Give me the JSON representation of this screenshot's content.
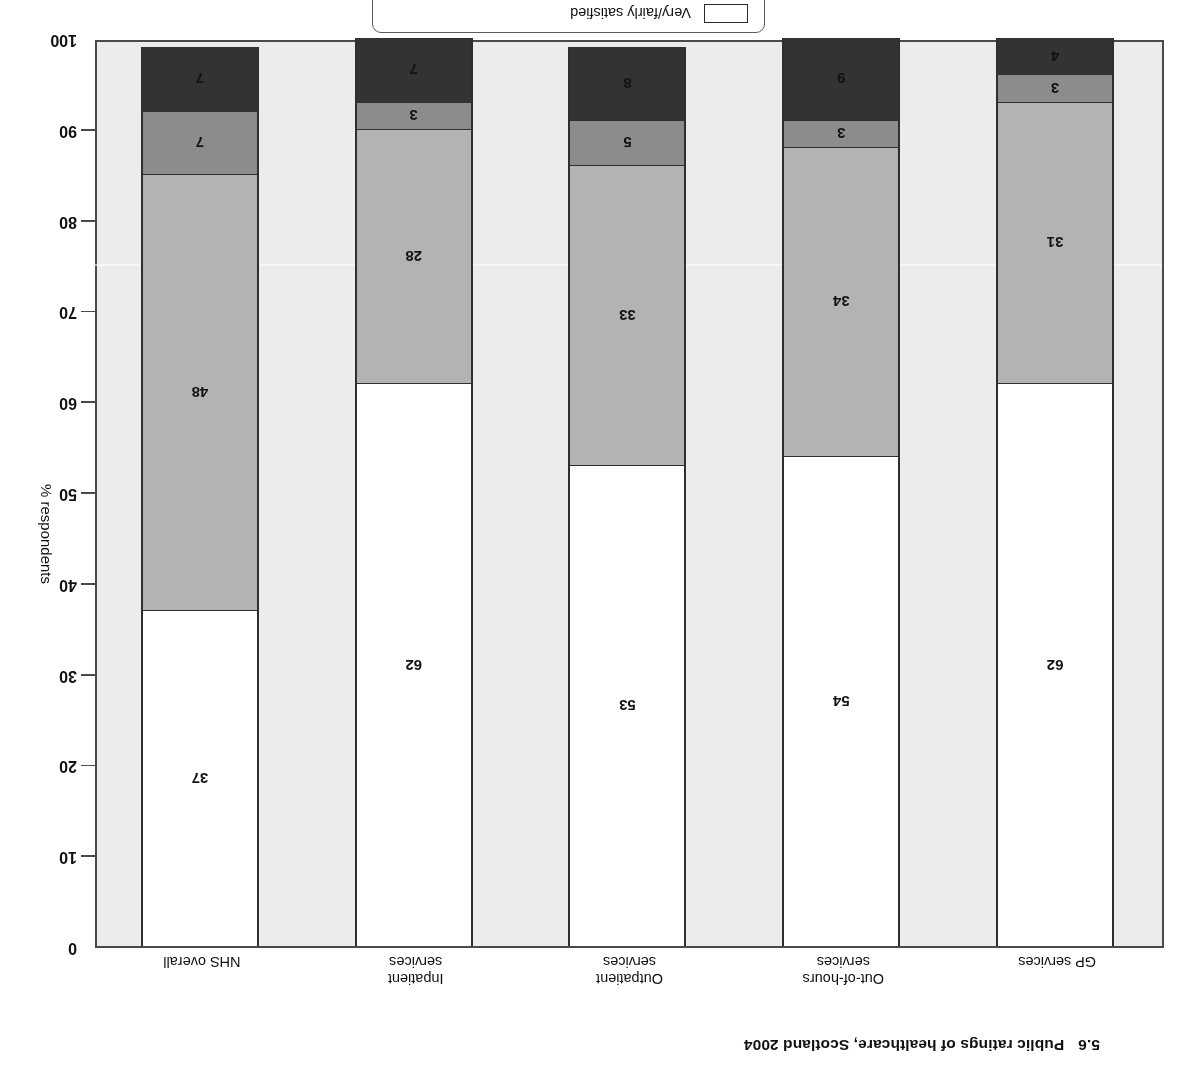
{
  "figure": {
    "number": "5.6",
    "title": "Public ratings of healthcare, Scotland 2004"
  },
  "axis": {
    "y_label": "% respondents",
    "y_ticks": [
      "0",
      "10",
      "20",
      "30",
      "40",
      "50",
      "60",
      "70",
      "80",
      "90",
      "100"
    ]
  },
  "legend": {
    "items": [
      {
        "label": "Very/fairly satisfied",
        "color": "#ffffff"
      },
      {
        "label": "Neither satisfied nor dissatisfied",
        "color": "#b3b3b3"
      },
      {
        "label": "Dissatisfied",
        "color": "#333333"
      }
    ],
    "visible_label": "Dissatisfied"
  },
  "chart_data": {
    "type": "bar",
    "xlabel": "",
    "ylabel": "% respondents",
    "ylim": [
      0,
      100
    ],
    "stacked": true,
    "grid": false,
    "legend_position": "top",
    "categories": [
      "GP services",
      "Out-of-hours services",
      "Outpatient services",
      "Inpatient services",
      "NHS overall"
    ],
    "category_lines": [
      [
        "GP services"
      ],
      [
        "Out-of-hours",
        "services"
      ],
      [
        "Outpatient",
        "services"
      ],
      [
        "Inpatient",
        "services"
      ],
      [
        "NHS overall"
      ]
    ],
    "series": [
      {
        "name": "Satisfied",
        "color": "#ffffff",
        "values": [
          62,
          54,
          53,
          62,
          37
        ]
      },
      {
        "name": "Neither",
        "color": "#b3b3b3",
        "values": [
          31,
          34,
          33,
          28,
          48
        ]
      },
      {
        "name": "Slightly dissatisfied",
        "color": "#8c8c8c",
        "values": [
          3,
          3,
          5,
          3,
          7
        ]
      },
      {
        "name": "Dissatisfied",
        "color": "#333333",
        "values": [
          4,
          9,
          8,
          7,
          7
        ]
      }
    ]
  },
  "colors": {
    "plot_background": "#ececec",
    "axis_line": "#4a4a4a",
    "bar_outline": "#2f2f2f",
    "text": "#111111"
  }
}
